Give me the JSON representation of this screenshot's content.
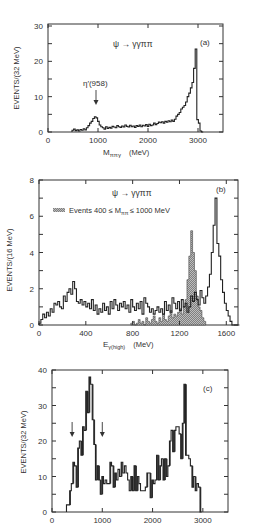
{
  "chart_data": [
    {
      "type": "bar",
      "panel_label": "(a)",
      "title": "ψ → γγππ",
      "xlabel": "M_ππγ (MeV)",
      "xlabel_main": "M",
      "xlabel_sub": "ππγ",
      "xlabel_unit": "(MeV)",
      "ylabel": "EVENTS/(32 MeV)",
      "xlim": [
        0,
        3500
      ],
      "ylim": [
        0,
        30
      ],
      "xticks": [
        0,
        1000,
        2000,
        3000
      ],
      "yticks": [
        0,
        10,
        20,
        30
      ],
      "annotation": "η′(958)",
      "annotation_x": 958,
      "bin_width": 32,
      "x": [
        480,
        512,
        544,
        576,
        608,
        640,
        672,
        704,
        736,
        768,
        800,
        832,
        864,
        896,
        928,
        960,
        992,
        1024,
        1056,
        1088,
        1120,
        1152,
        1184,
        1216,
        1248,
        1280,
        1312,
        1344,
        1376,
        1408,
        1440,
        1472,
        1504,
        1536,
        1568,
        1600,
        1632,
        1664,
        1696,
        1728,
        1760,
        1792,
        1824,
        1856,
        1888,
        1920,
        1952,
        1984,
        2016,
        2048,
        2080,
        2112,
        2144,
        2176,
        2208,
        2240,
        2272,
        2304,
        2336,
        2368,
        2400,
        2432,
        2464,
        2496,
        2528,
        2560,
        2592,
        2624,
        2656,
        2688,
        2720,
        2752,
        2784,
        2816,
        2848,
        2880,
        2912,
        2944,
        2976,
        3008,
        3040,
        3072
      ],
      "values": [
        0.5,
        0.8,
        0.4,
        0.6,
        0.3,
        0.7,
        0.5,
        0.9,
        0.6,
        1.2,
        1.8,
        2.5,
        3.0,
        3.8,
        4.3,
        4.0,
        3.0,
        2.0,
        1.5,
        1.2,
        0.8,
        1.5,
        1.0,
        1.3,
        1.1,
        1.6,
        1.4,
        1.2,
        1.8,
        1.5,
        1.3,
        1.7,
        1.4,
        2.0,
        1.6,
        1.4,
        1.9,
        1.5,
        1.7,
        1.3,
        1.8,
        1.6,
        2.0,
        1.5,
        1.9,
        1.7,
        2.1,
        1.6,
        2.2,
        1.8,
        2.0,
        2.5,
        2.1,
        2.4,
        2.8,
        2.6,
        2.9,
        2.5,
        3.0,
        2.8,
        3.2,
        2.9,
        3.4,
        3.0,
        3.6,
        4.5,
        5.0,
        5.5,
        6.5,
        7.0,
        7.5,
        8.5,
        10.0,
        11.0,
        12.5,
        14.0,
        18.0,
        23.5,
        3.5,
        2.5,
        0.3,
        0
      ]
    },
    {
      "type": "bar",
      "panel_label": "(b)",
      "title": "ψ → γγππ",
      "legend": "Events 400 ≤ M_ππ ≤ 1000 MeV",
      "legend_prefix": "Events 400 ≤ M",
      "legend_sub": "ππ",
      "legend_suffix": "≤ 1000 MeV",
      "xlabel": "E_γ(high) (MeV)",
      "xlabel_main": "E",
      "xlabel_sub": "γ(high)",
      "xlabel_unit": "(MeV)",
      "ylabel": "EVENTS/(16 MeV)",
      "xlim": [
        0,
        1700
      ],
      "ylim": [
        0,
        8
      ],
      "xticks": [
        0,
        400,
        800,
        1200,
        1600
      ],
      "yticks": [
        0,
        2,
        4,
        6,
        8
      ],
      "bin_width": 16,
      "series": [
        {
          "name": "All events",
          "x_start": 0,
          "values": [
            0.1,
            0.3,
            0.6,
            0.4,
            0.7,
            0.5,
            0.9,
            0.7,
            1.2,
            1.1,
            1.3,
            1.0,
            0.9,
            1.6,
            1.3,
            1.8,
            2.0,
            1.7,
            2.4,
            2.0,
            1.3,
            1.2,
            1.4,
            1.1,
            1.3,
            1.0,
            1.2,
            0.9,
            1.4,
            0.8,
            1.1,
            0.6,
            0.9,
            0.7,
            1.2,
            0.8,
            1.0,
            0.6,
            1.3,
            0.9,
            1.4,
            1.1,
            0.8,
            1.2,
            1.0,
            1.3,
            0.9,
            1.1,
            0.7,
            1.4,
            1.0,
            0.8,
            1.2,
            0.9,
            1.3,
            0.6,
            1.5,
            1.2,
            1.0,
            0.7,
            0.9,
            0.6,
            0.8,
            1.0,
            0.7,
            0.9,
            0.6,
            1.3,
            0.8,
            1.1,
            0.7,
            1.5,
            1.2,
            0.9,
            1.3,
            0.8,
            1.4,
            1.0,
            1.2,
            0.7,
            1.0,
            1.6,
            1.3,
            1.8,
            1.4,
            1.1,
            1.9,
            1.5,
            1.2,
            1.6,
            2.1,
            2.8,
            4.0,
            5.5,
            7.0,
            4.5,
            3.8,
            2.5,
            1.8,
            1.2,
            0.8,
            0.5,
            0.2,
            0,
            0,
            0,
            0
          ],
          "style": "outline"
        },
        {
          "name": "Events 400 ≤ Mππ ≤ 1000 MeV",
          "x_start": 784,
          "values": [
            0.1,
            0.2,
            0,
            0.1,
            0.3,
            0.1,
            0.2,
            0,
            0.4,
            0.2,
            0.1,
            0.3,
            0.5,
            0.2,
            0.1,
            0.4,
            0.2,
            0.6,
            0.3,
            0.2,
            0.5,
            0.8,
            0.4,
            0.6,
            0.5,
            0.7,
            0.9,
            0.6,
            1.0,
            1.4,
            2.5,
            3.8,
            5.2,
            4.0,
            3.0,
            1.6,
            1.0,
            0.8,
            0.4,
            0.2
          ],
          "style": "hatched"
        }
      ]
    },
    {
      "type": "bar",
      "panel_label": "(c)",
      "xlabel": "",
      "ylabel": "EVENTS/(32 MeV)",
      "xlim": [
        0,
        3500
      ],
      "ylim": [
        0,
        40
      ],
      "xticks": [
        0,
        1000,
        2000,
        3000
      ],
      "yticks": [
        0,
        10,
        20,
        30,
        40
      ],
      "arrows_x": [
        400,
        1000
      ],
      "bin_width": 32,
      "x_start": 288,
      "values": [
        2,
        2,
        6,
        8,
        14,
        13,
        7,
        18,
        20,
        16,
        24,
        23,
        34,
        28,
        38,
        36,
        26,
        19,
        9,
        13,
        9,
        5,
        10,
        8,
        9,
        8,
        8,
        14,
        13,
        7,
        11,
        9,
        12,
        10,
        14,
        11,
        13,
        11,
        9,
        6,
        10,
        6,
        13,
        6,
        10,
        8,
        6,
        6,
        6,
        7,
        11,
        11,
        4,
        9,
        8,
        9,
        16,
        9,
        13,
        15,
        9,
        15,
        10,
        13,
        20,
        23,
        17,
        23,
        24,
        24,
        22,
        15,
        25,
        36,
        16,
        16,
        15,
        13,
        7,
        10,
        6,
        8,
        7,
        0
      ],
      "shaded_hint": "dark vertical fill lines drawn inside tall bins"
    }
  ],
  "labels": {
    "panel_a": {
      "title": "ψ → γγππ",
      "tag": "(a)",
      "ylabel": "EVENTS/(32 MeV)",
      "xlabel_main": "M",
      "xlabel_sub": "ππγ",
      "xlabel_unit": "(MeV)",
      "annotation": "η′(958)",
      "yticks": [
        "0",
        "10",
        "20",
        "30"
      ],
      "xticks": [
        "0",
        "1000",
        "2000",
        "3000"
      ]
    },
    "panel_b": {
      "title": "ψ → γγππ",
      "tag": "(b)",
      "ylabel": "EVENTS/(16 MeV)",
      "legend_prefix": "Events 400 ≤ M",
      "legend_sub": "ππ",
      "legend_suffix": "≤ 1000 MeV",
      "xlabel_main": "E",
      "xlabel_sub": "γ(high)",
      "xlabel_unit": "(MeV)",
      "yticks": [
        "0",
        "2",
        "4",
        "6",
        "8"
      ],
      "xticks": [
        "0",
        "400",
        "800",
        "1200",
        "1600"
      ]
    },
    "panel_c": {
      "tag": "(c)",
      "ylabel": "EVENTS/(32 MeV)",
      "yticks": [
        "0",
        "10",
        "20",
        "30",
        "40"
      ],
      "xticks": [
        "0",
        "1000",
        "2000",
        "3000"
      ]
    }
  }
}
